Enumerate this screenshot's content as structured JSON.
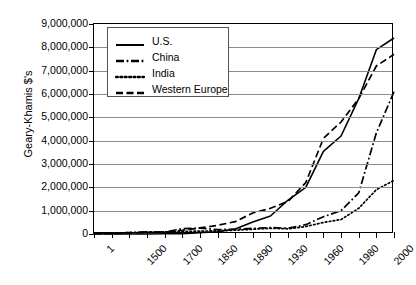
{
  "chart_data": {
    "type": "line",
    "title": "",
    "xlabel": "",
    "ylabel": "Geary-Khamis $'s",
    "ylim": [
      0,
      9000000
    ],
    "ytick_labels": [
      "9,000,000",
      "8,000,000",
      "7,000,000",
      "6,000,000",
      "5,000,000",
      "4,000,000",
      "3,000,000",
      "2,000,000",
      "1,000,000",
      "0"
    ],
    "ytick_values": [
      9000000,
      8000000,
      7000000,
      6000000,
      5000000,
      4000000,
      3000000,
      2000000,
      1000000,
      0
    ],
    "grid": true,
    "legend_position": "top-left",
    "x_tick_labels": [
      "1",
      "1500",
      "1700",
      "1850",
      "1890",
      "1930",
      "1960",
      "1980",
      "2000"
    ],
    "x_points": [
      "1",
      "1000",
      "1500",
      "1600",
      "1700",
      "1820",
      "1850",
      "1870",
      "1890",
      "1913",
      "1930",
      "1950",
      "1960",
      "1973",
      "1980",
      "1990",
      "2000",
      "2003"
    ],
    "series": [
      {
        "name": "U.S.",
        "style": "solid",
        "values": [
          0,
          0,
          0,
          0,
          10000,
          13000,
          60000,
          98000,
          215000,
          517000,
          770000,
          1456000,
          2000000,
          3537000,
          4200000,
          5800000,
          7900000,
          8400000
        ]
      },
      {
        "name": "China",
        "style": "dash-dot",
        "values": [
          27000,
          27000,
          62000,
          96000,
          83000,
          229000,
          248000,
          190000,
          205000,
          241000,
          275000,
          245000,
          400000,
          740000,
          1000000,
          1760000,
          4330000,
          6100000
        ]
      },
      {
        "name": "India",
        "style": "dotted",
        "values": [
          34000,
          34000,
          60000,
          74000,
          90000,
          111000,
          125000,
          134000,
          163000,
          204000,
          244000,
          222000,
          320000,
          495000,
          620000,
          1100000,
          1900000,
          2300000
        ]
      },
      {
        "name": "Western Europe",
        "style": "dashed",
        "values": [
          14000,
          11000,
          44000,
          66000,
          83000,
          160000,
          260000,
          370000,
          530000,
          900000,
          1100000,
          1400000,
          2200000,
          4100000,
          4800000,
          5800000,
          7200000,
          7700000
        ]
      }
    ]
  },
  "legend": {
    "items": [
      {
        "label": "U.S."
      },
      {
        "label": "China"
      },
      {
        "label": "India"
      },
      {
        "label": "Western Europe"
      }
    ]
  }
}
